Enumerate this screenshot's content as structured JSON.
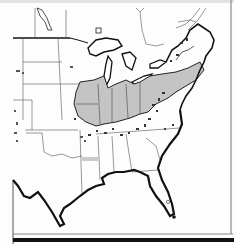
{
  "map": {
    "subject": "Eastern United States",
    "style": "black-and-white line map with shaded region",
    "colors": {
      "background": "#fdfdfd",
      "land": "#ffffff",
      "shaded_region": "#c4c4c4",
      "outline": "#111111",
      "state_border": "#555555",
      "frame": "#8a8a8a",
      "bottom_bar": "#111111"
    },
    "labels": []
  }
}
